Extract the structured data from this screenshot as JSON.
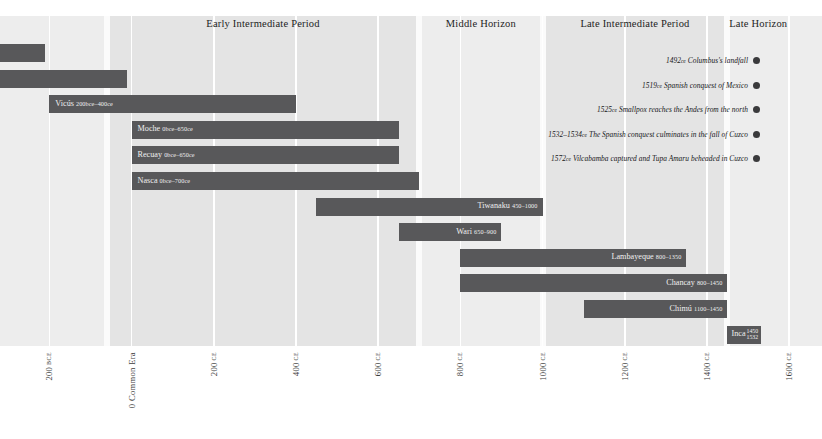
{
  "chart_data": {
    "type": "bar",
    "title": "",
    "xlabel": "",
    "ylabel": "",
    "orientation": "horizontal-timeline",
    "xlim": [
      -320,
      1680
    ],
    "grid": true,
    "legend": "none",
    "periods": [
      {
        "label": "Early Intermediate Period",
        "start": -60,
        "end": 700
      },
      {
        "label": "Middle Horizon",
        "start": 700,
        "end": 1000
      },
      {
        "label": "Late Intermediate Period",
        "start": 1000,
        "end": 1450
      },
      {
        "label": "Late Horizon",
        "start": 1450,
        "end": 1600
      }
    ],
    "categories": [
      "unnamed-1",
      "unnamed-2",
      "Vicús",
      "Moche",
      "Recuay",
      "Nasca",
      "Tiwanaku",
      "Wari",
      "Lambayeque",
      "Chancay",
      "Chimú",
      "Inca"
    ],
    "bars": [
      {
        "name": "",
        "label": "",
        "era_label": "",
        "start": -320,
        "end": -210,
        "row": 0,
        "truncated_left": true
      },
      {
        "name": "",
        "label": "",
        "era_label": "",
        "start": -320,
        "end": -10,
        "row": 1,
        "truncated_left": true
      },
      {
        "name": "Vicús",
        "label": "Vicús",
        "era_label": "200bce–400ce",
        "start": -200,
        "end": 400,
        "row": 2
      },
      {
        "name": "Moche",
        "label": "Moche",
        "era_label": "0bce–650ce",
        "start": 0,
        "end": 650,
        "row": 3
      },
      {
        "name": "Recuay",
        "label": "Recuay",
        "era_label": "0bce–650ce",
        "start": 0,
        "end": 650,
        "row": 4
      },
      {
        "name": "Nasca",
        "label": "Nasca",
        "era_label": "0bce–700ce",
        "start": 0,
        "end": 700,
        "row": 5
      },
      {
        "name": "Tiwanaku",
        "label": "Tiwanaku",
        "era_label": "450–1000",
        "start": 450,
        "end": 1000,
        "row": 6
      },
      {
        "name": "Wari",
        "label": "Wari",
        "era_label": "650–900",
        "start": 650,
        "end": 900,
        "row": 7
      },
      {
        "name": "Lambayeque",
        "label": "Lambayeque",
        "era_label": "800–1350",
        "start": 800,
        "end": 1350,
        "row": 8
      },
      {
        "name": "Chancay",
        "label": "Chancay",
        "era_label": "800–1450",
        "start": 800,
        "end": 1450,
        "row": 9
      },
      {
        "name": "Chimú",
        "label": "Chimú",
        "era_label": "1100–1450",
        "start": 1100,
        "end": 1450,
        "row": 10
      },
      {
        "name": "Inca",
        "label": "Inca",
        "era_label": "1450–1532",
        "start": 1450,
        "end": 1532,
        "row": 11
      }
    ],
    "events": [
      {
        "year": "1492",
        "era": "ce",
        "text": "Columbus's landfall"
      },
      {
        "year": "1519",
        "era": "ce",
        "text": "Spanish conquest of Mexico"
      },
      {
        "year": "1525",
        "era": "ce",
        "text": "Smallpox reaches the Andes from the north"
      },
      {
        "year": "1532–1534",
        "era": "ce",
        "text": "The Spanish conquest culminates in the fall of Cuzco"
      },
      {
        "year": "1572",
        "era": "ce",
        "text": "Vilcabamba captured and Tupa Amaru beheaded in Cuzco"
      }
    ],
    "axis_ticks": [
      {
        "value": "200",
        "era": "bce",
        "pos": -200
      },
      {
        "value": "0 Common Era",
        "era": "",
        "pos": 0
      },
      {
        "value": "200",
        "era": "ce",
        "pos": 200
      },
      {
        "value": "400",
        "era": "ce",
        "pos": 400
      },
      {
        "value": "600",
        "era": "ce",
        "pos": 600
      },
      {
        "value": "800",
        "era": "ce",
        "pos": 800
      },
      {
        "value": "1000",
        "era": "ce",
        "pos": 1000
      },
      {
        "value": "1200",
        "era": "ce",
        "pos": 1200
      },
      {
        "value": "1400",
        "era": "ce",
        "pos": 1400
      },
      {
        "value": "1600",
        "era": "ce",
        "pos": 1600
      }
    ],
    "colors": {
      "bar": "#58585a",
      "band": "#e4e4e4",
      "band_pale": "#ededed",
      "background": "#ffffff",
      "gridline": "#ffffff",
      "dot": "#3a3a3c",
      "bar_text": "#efefef"
    }
  }
}
